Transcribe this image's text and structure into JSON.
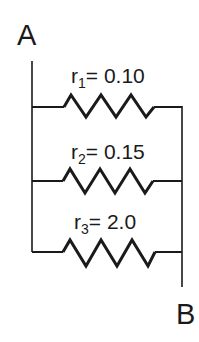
{
  "diagram": {
    "type": "parallel-resistor-circuit",
    "nodes": {
      "start": {
        "label": "A"
      },
      "end": {
        "label": "B"
      }
    },
    "resistors": [
      {
        "symbol": "r",
        "subscript": "1",
        "equals": "= ",
        "value": "0.10"
      },
      {
        "symbol": "r",
        "subscript": "2",
        "equals": "= ",
        "value": "0.15"
      },
      {
        "symbol": "r",
        "subscript": "3",
        "equals": "= ",
        "value": "2.0"
      }
    ],
    "colors": {
      "line": "#1a1a1a",
      "background": "#ffffff"
    }
  }
}
